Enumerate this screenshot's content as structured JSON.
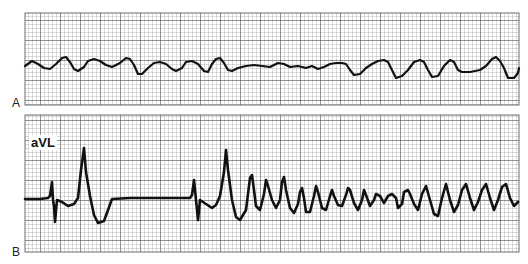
{
  "figure": {
    "panels": [
      {
        "id": "A",
        "label": "A",
        "lead": ""
      },
      {
        "id": "B",
        "label": "B",
        "lead": "aVL"
      }
    ]
  },
  "colors": {
    "grid_minor": "#9a9a9a",
    "grid_major": "#3a3a3a",
    "trace": "#111111",
    "paper": "#ffffff"
  },
  "chart_data": [
    {
      "type": "line",
      "title": "",
      "panel_label": "A",
      "lead_label": "",
      "xlabel": "",
      "ylabel": "",
      "grid": true,
      "description": "Coarse irregular undulating waveform on ECG grid paper",
      "points": [
        [
          25,
          66
        ],
        [
          32,
          61
        ],
        [
          38,
          64
        ],
        [
          44,
          68
        ],
        [
          50,
          69
        ],
        [
          56,
          64
        ],
        [
          62,
          58
        ],
        [
          66,
          57
        ],
        [
          70,
          62
        ],
        [
          74,
          69
        ],
        [
          78,
          71
        ],
        [
          84,
          67
        ],
        [
          88,
          61
        ],
        [
          94,
          59
        ],
        [
          100,
          61
        ],
        [
          106,
          65
        ],
        [
          112,
          67
        ],
        [
          120,
          63
        ],
        [
          126,
          58
        ],
        [
          130,
          59
        ],
        [
          134,
          65
        ],
        [
          138,
          74
        ],
        [
          142,
          74
        ],
        [
          148,
          68
        ],
        [
          154,
          63
        ],
        [
          160,
          62
        ],
        [
          166,
          64
        ],
        [
          172,
          69
        ],
        [
          176,
          71
        ],
        [
          182,
          68
        ],
        [
          186,
          62
        ],
        [
          192,
          61
        ],
        [
          198,
          64
        ],
        [
          204,
          71
        ],
        [
          208,
          72
        ],
        [
          212,
          64
        ],
        [
          216,
          59
        ],
        [
          220,
          58
        ],
        [
          224,
          63
        ],
        [
          228,
          70
        ],
        [
          232,
          71
        ],
        [
          238,
          68
        ],
        [
          246,
          66
        ],
        [
          254,
          65
        ],
        [
          262,
          66
        ],
        [
          270,
          67
        ],
        [
          278,
          63
        ],
        [
          284,
          64
        ],
        [
          290,
          67
        ],
        [
          298,
          66
        ],
        [
          306,
          68
        ],
        [
          312,
          66
        ],
        [
          318,
          69
        ],
        [
          324,
          67
        ],
        [
          330,
          64
        ],
        [
          336,
          63
        ],
        [
          342,
          63
        ],
        [
          346,
          64
        ],
        [
          350,
          70
        ],
        [
          354,
          75
        ],
        [
          360,
          74
        ],
        [
          366,
          68
        ],
        [
          372,
          64
        ],
        [
          378,
          61
        ],
        [
          384,
          60
        ],
        [
          388,
          62
        ],
        [
          392,
          70
        ],
        [
          396,
          78
        ],
        [
          402,
          76
        ],
        [
          408,
          70
        ],
        [
          414,
          62
        ],
        [
          420,
          60
        ],
        [
          424,
          62
        ],
        [
          428,
          70
        ],
        [
          432,
          77
        ],
        [
          438,
          76
        ],
        [
          444,
          66
        ],
        [
          450,
          60
        ],
        [
          454,
          62
        ],
        [
          458,
          70
        ],
        [
          462,
          72
        ],
        [
          470,
          72
        ],
        [
          480,
          70
        ],
        [
          486,
          66
        ],
        [
          492,
          59
        ],
        [
          496,
          57
        ],
        [
          500,
          61
        ],
        [
          504,
          68
        ],
        [
          508,
          78
        ],
        [
          514,
          78
        ],
        [
          518,
          73
        ],
        [
          519,
          68
        ]
      ]
    },
    {
      "type": "line",
      "title": "",
      "panel_label": "B",
      "lead_label": "aVL",
      "xlabel": "",
      "ylabel": "",
      "grid": true,
      "description": "Paced/sinus complex, pause, then polymorphic rapid oscillation (torsades-like)",
      "points": [
        [
          25,
          199
        ],
        [
          40,
          199
        ],
        [
          48,
          198
        ],
        [
          50,
          196
        ],
        [
          52,
          182
        ],
        [
          53,
          200
        ],
        [
          54,
          206
        ],
        [
          55,
          222
        ],
        [
          57,
          200
        ],
        [
          62,
          202
        ],
        [
          68,
          206
        ],
        [
          74,
          204
        ],
        [
          78,
          198
        ],
        [
          81,
          170
        ],
        [
          84,
          148
        ],
        [
          86,
          172
        ],
        [
          90,
          196
        ],
        [
          94,
          215
        ],
        [
          98,
          223
        ],
        [
          104,
          221
        ],
        [
          108,
          210
        ],
        [
          112,
          199
        ],
        [
          130,
          198
        ],
        [
          160,
          198
        ],
        [
          190,
          198
        ],
        [
          192,
          195
        ],
        [
          194,
          180
        ],
        [
          196,
          200
        ],
        [
          197,
          210
        ],
        [
          198,
          220
        ],
        [
          200,
          200
        ],
        [
          206,
          204
        ],
        [
          212,
          208
        ],
        [
          216,
          205
        ],
        [
          220,
          196
        ],
        [
          224,
          172
        ],
        [
          226,
          150
        ],
        [
          228,
          170
        ],
        [
          232,
          200
        ],
        [
          236,
          217
        ],
        [
          240,
          220
        ],
        [
          246,
          210
        ],
        [
          248,
          194
        ],
        [
          250,
          178
        ],
        [
          252,
          175
        ],
        [
          254,
          190
        ],
        [
          256,
          206
        ],
        [
          260,
          210
        ],
        [
          264,
          194
        ],
        [
          266,
          180
        ],
        [
          268,
          186
        ],
        [
          272,
          200
        ],
        [
          276,
          208
        ],
        [
          280,
          200
        ],
        [
          282,
          182
        ],
        [
          284,
          177
        ],
        [
          286,
          190
        ],
        [
          290,
          208
        ],
        [
          294,
          213
        ],
        [
          298,
          204
        ],
        [
          300,
          192
        ],
        [
          302,
          188
        ],
        [
          304,
          198
        ],
        [
          306,
          212
        ],
        [
          310,
          212
        ],
        [
          314,
          196
        ],
        [
          316,
          186
        ],
        [
          318,
          192
        ],
        [
          322,
          208
        ],
        [
          326,
          210
        ],
        [
          330,
          196
        ],
        [
          332,
          190
        ],
        [
          334,
          196
        ],
        [
          338,
          205
        ],
        [
          342,
          206
        ],
        [
          346,
          195
        ],
        [
          348,
          188
        ],
        [
          350,
          190
        ],
        [
          354,
          203
        ],
        [
          358,
          210
        ],
        [
          362,
          200
        ],
        [
          364,
          190
        ],
        [
          366,
          195
        ],
        [
          370,
          206
        ],
        [
          374,
          200
        ],
        [
          376,
          194
        ],
        [
          380,
          196
        ],
        [
          384,
          203
        ],
        [
          388,
          196
        ],
        [
          392,
          194
        ],
        [
          396,
          198
        ],
        [
          398,
          208
        ],
        [
          402,
          204
        ],
        [
          404,
          192
        ],
        [
          408,
          190
        ],
        [
          410,
          194
        ],
        [
          414,
          204
        ],
        [
          418,
          210
        ],
        [
          422,
          194
        ],
        [
          426,
          186
        ],
        [
          430,
          200
        ],
        [
          434,
          214
        ],
        [
          438,
          216
        ],
        [
          442,
          198
        ],
        [
          446,
          184
        ],
        [
          450,
          200
        ],
        [
          454,
          212
        ],
        [
          458,
          205
        ],
        [
          462,
          190
        ],
        [
          466,
          184
        ],
        [
          470,
          198
        ],
        [
          474,
          210
        ],
        [
          478,
          202
        ],
        [
          482,
          190
        ],
        [
          486,
          184
        ],
        [
          490,
          198
        ],
        [
          494,
          210
        ],
        [
          498,
          200
        ],
        [
          502,
          187
        ],
        [
          506,
          184
        ],
        [
          510,
          198
        ],
        [
          514,
          206
        ],
        [
          518,
          202
        ]
      ]
    }
  ]
}
